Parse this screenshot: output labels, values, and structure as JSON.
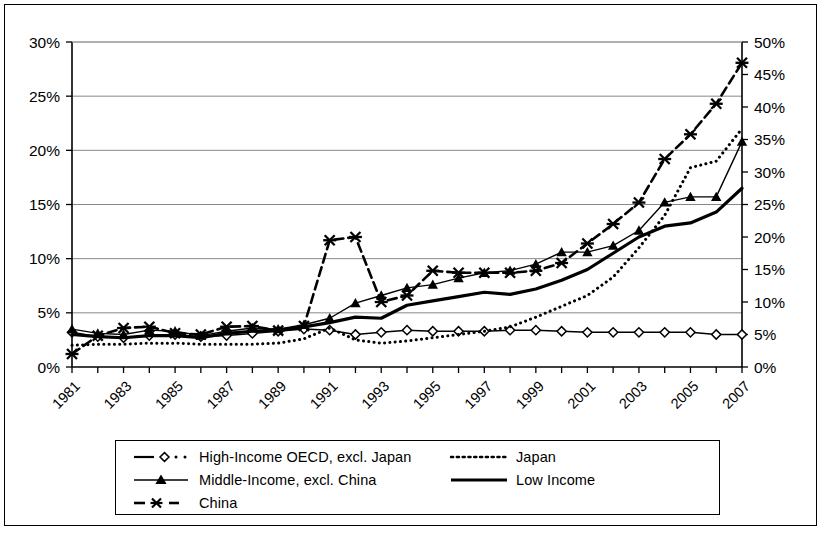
{
  "chart_data": {
    "type": "line",
    "title": "",
    "subtitle": "",
    "xlabel": "",
    "ylabel": "",
    "y2label": "",
    "grid": true,
    "legend_position": "bottom",
    "x": [
      1981,
      1982,
      1983,
      1984,
      1985,
      1986,
      1987,
      1988,
      1989,
      1990,
      1991,
      1992,
      1993,
      1994,
      1995,
      1996,
      1997,
      1998,
      1999,
      2000,
      2001,
      2002,
      2003,
      2004,
      2005,
      2006,
      2007
    ],
    "xtick_labels": [
      "1981",
      "1983",
      "1985",
      "1987",
      "1989",
      "1991",
      "1993",
      "1995",
      "1997",
      "1999",
      "2001",
      "2003",
      "2005",
      "2007"
    ],
    "xlim": [
      1981,
      2007
    ],
    "ylim": [
      0,
      30
    ],
    "ytick_labels": [
      "0%",
      "5%",
      "10%",
      "15%",
      "20%",
      "25%",
      "30%"
    ],
    "ytick_values": [
      0,
      5,
      10,
      15,
      20,
      25,
      30
    ],
    "y2lim": [
      0,
      50
    ],
    "y2tick_labels": [
      "0%",
      "5%",
      "10%",
      "15%",
      "20%",
      "25%",
      "30%",
      "35%",
      "40%",
      "45%",
      "50%"
    ],
    "y2tick_values": [
      0,
      5,
      10,
      15,
      20,
      25,
      30,
      35,
      40,
      45,
      50
    ],
    "series": [
      {
        "name": "High-Income OECD, excl. Japan",
        "axis": "left",
        "style": "solid-dotted",
        "marker": "diamond-open",
        "values": [
          3.2,
          2.8,
          2.7,
          2.9,
          3.0,
          2.8,
          2.9,
          3.1,
          3.3,
          3.5,
          3.4,
          3.0,
          3.2,
          3.4,
          3.3,
          3.3,
          3.3,
          3.4,
          3.4,
          3.3,
          3.2,
          3.2,
          3.2,
          3.2,
          3.2,
          3.0,
          3.0
        ]
      },
      {
        "name": "Japan",
        "axis": "left",
        "style": "dotted",
        "marker": "none",
        "values": [
          2.0,
          2.1,
          2.1,
          2.2,
          2.2,
          2.1,
          2.1,
          2.1,
          2.2,
          2.6,
          3.6,
          2.5,
          2.2,
          2.4,
          2.7,
          3.0,
          3.3,
          3.7,
          4.6,
          5.6,
          6.6,
          8.3,
          11.0,
          14.0,
          18.4,
          19.0,
          22.0
        ]
      },
      {
        "name": "Middle-Income, excl. China",
        "axis": "left",
        "style": "solid",
        "marker": "triangle-filled",
        "values": [
          3.5,
          3.1,
          3.0,
          3.4,
          3.3,
          2.9,
          3.3,
          3.6,
          3.5,
          3.9,
          4.5,
          5.9,
          6.6,
          7.3,
          7.6,
          8.2,
          8.7,
          8.9,
          9.5,
          10.6,
          10.6,
          11.2,
          12.6,
          15.2,
          15.7,
          15.7,
          20.8
        ]
      },
      {
        "name": "Low Income",
        "axis": "left",
        "style": "solid-thick",
        "marker": "none",
        "values": [
          3.0,
          2.8,
          2.7,
          2.9,
          2.9,
          2.7,
          3.1,
          3.3,
          3.4,
          3.7,
          4.1,
          4.6,
          4.5,
          5.7,
          6.1,
          6.5,
          6.9,
          6.7,
          7.2,
          8.0,
          9.0,
          10.5,
          12.0,
          13.0,
          13.3,
          14.3,
          16.5
        ]
      },
      {
        "name": "China",
        "axis": "right",
        "style": "dashed",
        "marker": "cross",
        "values": [
          2.0,
          4.8,
          6.0,
          6.2,
          5.2,
          5.0,
          6.2,
          6.3,
          5.6,
          6.3,
          19.5,
          20.0,
          10.0,
          11.0,
          14.8,
          14.5,
          14.5,
          14.5,
          14.8,
          16.0,
          19.0,
          22.0,
          25.3,
          32.0,
          35.8,
          40.5,
          46.8
        ]
      }
    ]
  },
  "legend": {
    "entries": [
      {
        "label": "High-Income OECD, excl. Japan",
        "marker": "diamond-open-icon"
      },
      {
        "label": "Middle-Income, excl. China",
        "marker": "triangle-filled-icon"
      },
      {
        "label": "China",
        "marker": "cross-icon"
      },
      {
        "label": "Japan",
        "marker": "dotted-line-icon"
      },
      {
        "label": "Low Income",
        "marker": "solid-line-icon"
      }
    ]
  }
}
